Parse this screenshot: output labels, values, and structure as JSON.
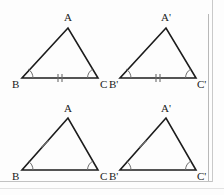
{
  "document": {
    "type": "geometry-diagram",
    "description": "Four triangles arranged in two rows showing congruent triangle pairs"
  },
  "figures": [
    {
      "id": "top-left",
      "name": "triangle-abc-top",
      "vertices": {
        "A": {
          "label": "A",
          "x": 68,
          "y": 28
        },
        "B": {
          "label": "B",
          "x": 22,
          "y": 78
        },
        "C": {
          "label": "C",
          "x": 98,
          "y": 78
        }
      },
      "angle_marks": [
        {
          "at": "B",
          "style": "single-arc"
        },
        {
          "at": "C",
          "style": "single-arc"
        }
      ],
      "side_ticks": [
        {
          "side": "BC",
          "count": 2
        }
      ]
    },
    {
      "id": "top-right",
      "name": "triangle-abc-prime-top",
      "vertices": {
        "A": {
          "label": "A'",
          "x": 166,
          "y": 28
        },
        "B": {
          "label": "B'",
          "x": 120,
          "y": 78
        },
        "C": {
          "label": "C'",
          "x": 196,
          "y": 78
        }
      },
      "angle_marks": [
        {
          "at": "B",
          "style": "single-arc"
        },
        {
          "at": "C",
          "style": "single-arc"
        }
      ],
      "side_ticks": [
        {
          "side": "BC",
          "count": 2
        }
      ]
    },
    {
      "id": "bottom-left",
      "name": "triangle-abc-bottom",
      "vertices": {
        "A": {
          "label": "A",
          "x": 68,
          "y": 118
        },
        "B": {
          "label": "B",
          "x": 22,
          "y": 170
        },
        "C": {
          "label": "C",
          "x": 98,
          "y": 170
        }
      },
      "angle_marks": [
        {
          "at": "B",
          "style": "single-arc"
        },
        {
          "at": "C",
          "style": "single-arc"
        }
      ],
      "side_ticks": [
        {
          "side": "AB",
          "count": 1
        }
      ]
    },
    {
      "id": "bottom-right",
      "name": "triangle-abc-prime-bottom",
      "vertices": {
        "A": {
          "label": "A'",
          "x": 166,
          "y": 118
        },
        "B": {
          "label": "B'",
          "x": 120,
          "y": 170
        },
        "C": {
          "label": "C'",
          "x": 196,
          "y": 170
        }
      },
      "angle_marks": [
        {
          "at": "B",
          "style": "single-arc"
        },
        {
          "at": "C",
          "style": "single-arc"
        }
      ],
      "side_ticks": [
        {
          "side": "AB",
          "count": 1
        }
      ]
    }
  ],
  "labels": {
    "tl_A": "A",
    "tl_B": "B",
    "tl_C": "C",
    "tr_A": "A'",
    "tr_B": "B'",
    "tr_C": "C'",
    "bl_A": "A",
    "bl_B": "B",
    "bl_C": "C",
    "br_A": "A'",
    "br_B": "B'",
    "br_C": "C'"
  },
  "colors": {
    "stroke": "#1c1c1c",
    "mark": "#6b6b6b",
    "background": "#fdfdfd",
    "frame": "#c9c9c9"
  }
}
